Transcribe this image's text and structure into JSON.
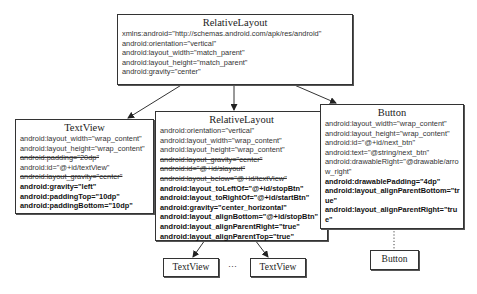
{
  "diagram": {
    "root": {
      "title": "RelativeLayout",
      "lines": [
        {
          "text": "xmlns:android=\"http://schemas.android.com/apk/res/android\"",
          "style": "normal"
        },
        {
          "text": "android:orientation=\"vertical\"",
          "style": "normal"
        },
        {
          "text": "android:layout_width=\"match_parent\"",
          "style": "normal"
        },
        {
          "text": "android:layout_height=\"match_parent\"",
          "style": "normal"
        },
        {
          "text": "android:gravity=\"center\"",
          "style": "normal"
        }
      ]
    },
    "textview": {
      "title": "TextView",
      "lines": [
        {
          "text": "android:layout_width=\"wrap_content\"",
          "style": "normal"
        },
        {
          "text": "android:layout_height=\"wrap_content\"",
          "style": "normal"
        },
        {
          "text": "android:padding=\"20dp\"",
          "style": "strike"
        },
        {
          "text": "android:id=\"@+id/textView\"",
          "style": "normal"
        },
        {
          "text": "android:layout_gravity=\"center\"",
          "style": "strike"
        },
        {
          "text": "android:gravity=\"left\"",
          "style": "bold"
        },
        {
          "text": "android:paddingTop=\"10dp\"",
          "style": "bold"
        },
        {
          "text": "android:paddingBottom=\"10dp\"",
          "style": "bold"
        }
      ]
    },
    "inner_layout": {
      "title": "RelativeLayout",
      "lines": [
        {
          "text": "android:orientation=\"vertical\"",
          "style": "normal"
        },
        {
          "text": "android:layout_width=\"wrap_content\"",
          "style": "normal"
        },
        {
          "text": "android:layout_height=\"wrap_content\"",
          "style": "normal"
        },
        {
          "text": "android:layout_gravity=\"center\"",
          "style": "strike"
        },
        {
          "text": "android:id=\"@+id/slayout\"",
          "style": "strike"
        },
        {
          "text": "android:layout_below=\"@+id/textView\"",
          "style": "strike"
        },
        {
          "text": "android:layout_toLeftOf=\"@+id/stopBtn\"",
          "style": "bold"
        },
        {
          "text": "android:layout_toRightOf=\"@+id/startBtn\"",
          "style": "bold"
        },
        {
          "text": "android:gravity=\"center_horizontal\"",
          "style": "bold"
        },
        {
          "text": "android:layout_alignBottom=\"@+id/stopBtn\"",
          "style": "bold"
        },
        {
          "text": "android:layout_alignParentRight=\"true\"",
          "style": "bold"
        },
        {
          "text": "android:layout_alignParentTop=\"true\"",
          "style": "bold"
        }
      ],
      "children": [
        {
          "label": "TextView"
        },
        {
          "label": "TextView"
        }
      ],
      "ellipsis": "···"
    },
    "button": {
      "title": "Button",
      "lines": [
        {
          "text": "android:layout_width=\"wrap_content\"",
          "style": "normal"
        },
        {
          "text": "android:layout_height=\"wrap_content\"",
          "style": "normal"
        },
        {
          "text": "android:id=\"@+id/next_btn\"",
          "style": "normal"
        },
        {
          "text": "android:text=\"@string/next_btn\"",
          "style": "normal"
        },
        {
          "text": "android:drawableRight=\"@drawable/arrow_right\"",
          "style": "normal"
        },
        {
          "text": "android:drawablePadding=\"4dp\"",
          "style": "bold"
        },
        {
          "text": "android:layout_alignParentBottom=\"true\"",
          "style": "bold"
        },
        {
          "text": "android:layout_alignParentRight=\"true\"",
          "style": "bold"
        }
      ],
      "child": {
        "label": "Button"
      }
    }
  }
}
